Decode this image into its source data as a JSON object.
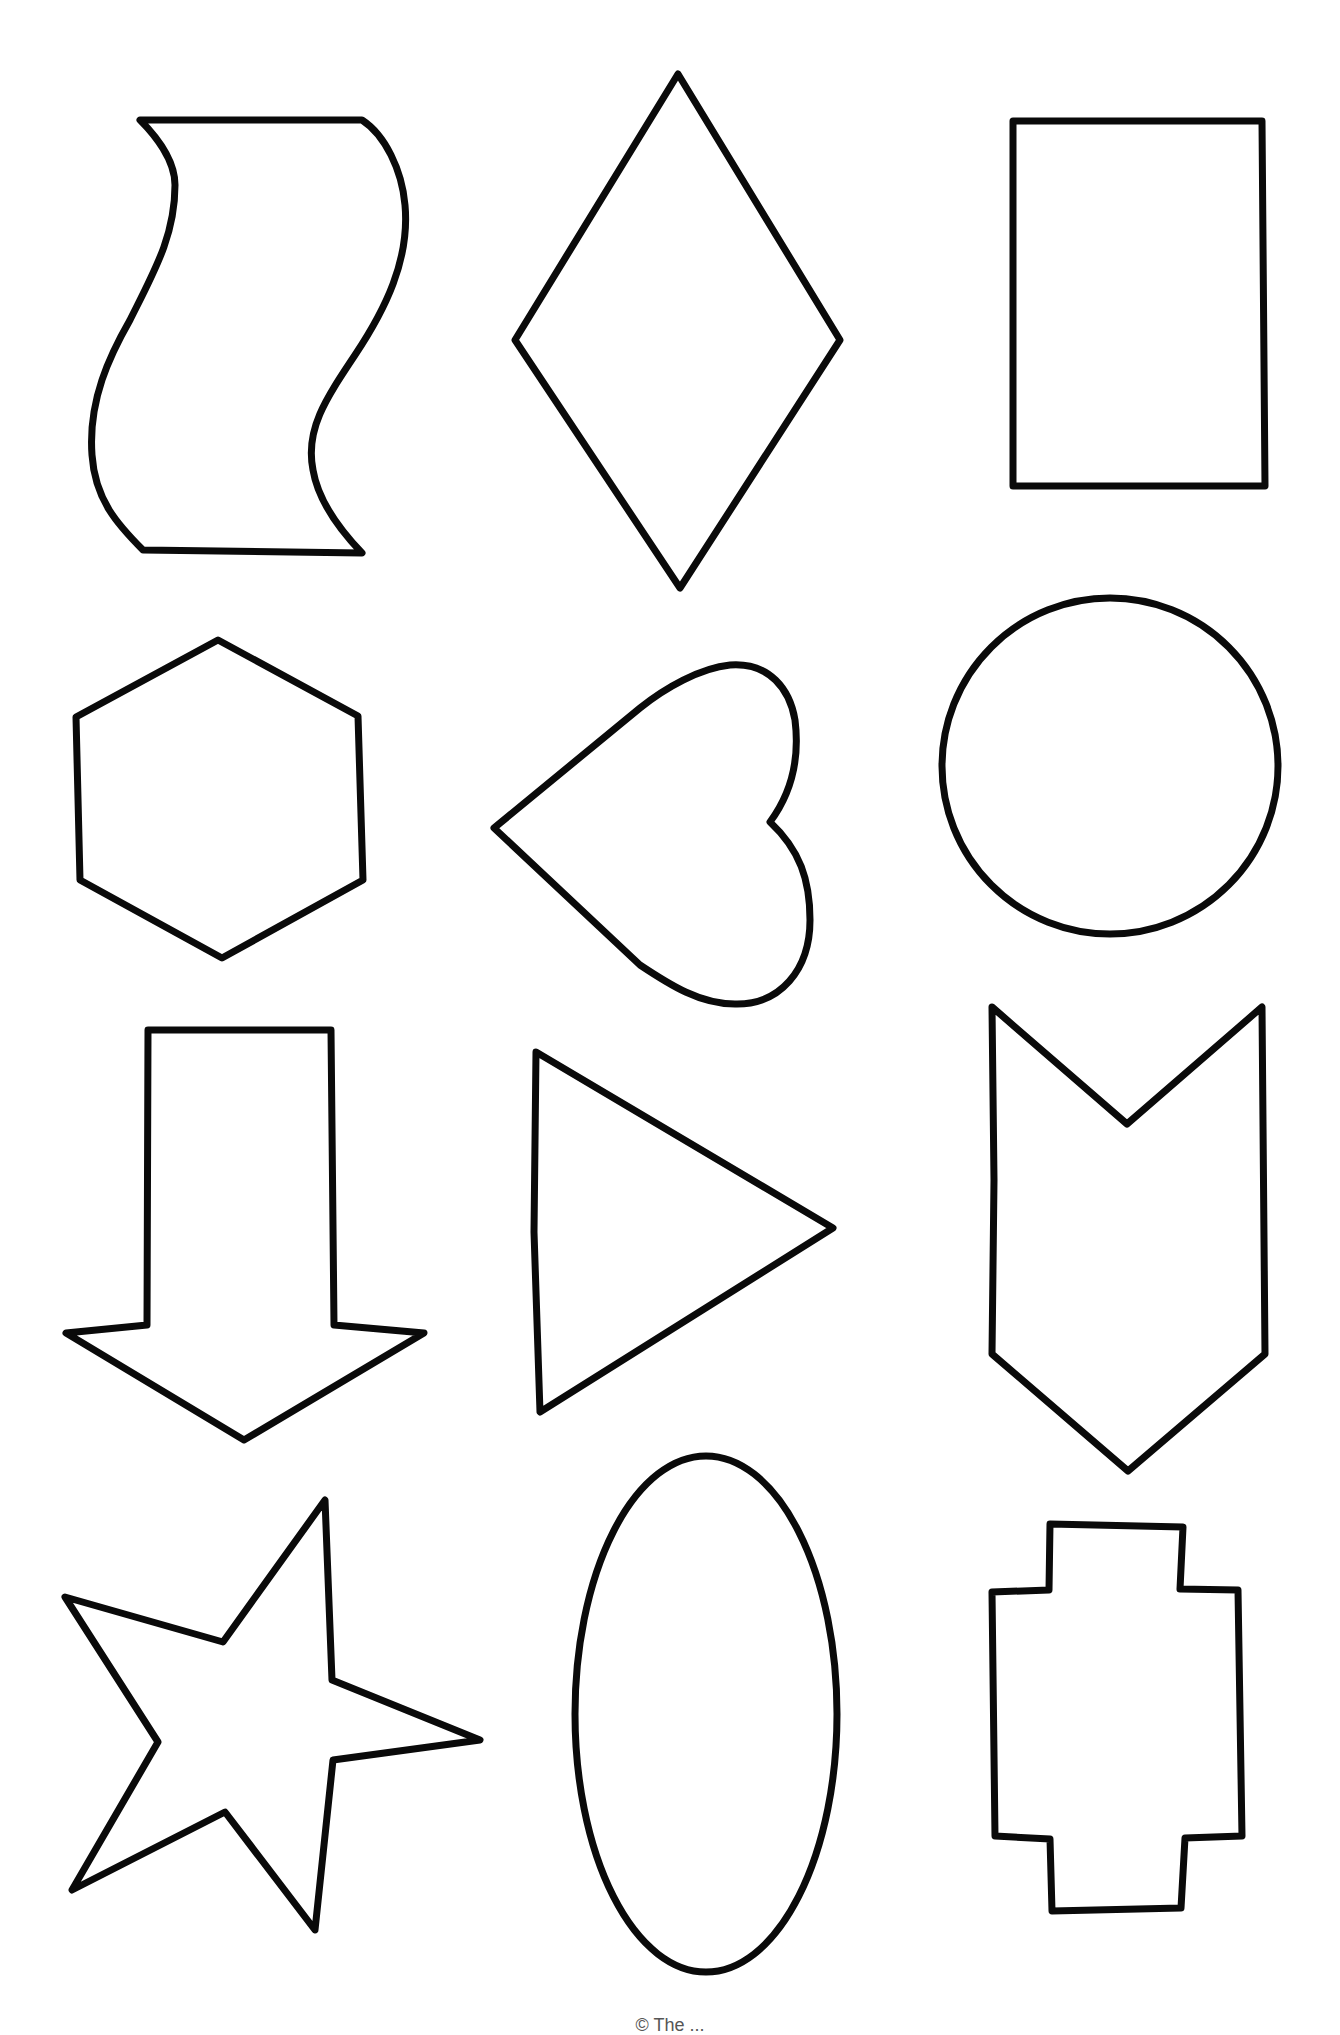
{
  "page": {
    "type": "shapes-worksheet",
    "background_color": "#ffffff",
    "stroke_color": "#0a0a0a",
    "layout": {
      "columns": 3,
      "rows": 4
    }
  },
  "shapes": [
    {
      "row": 1,
      "col": 1,
      "name": "wavy-banner"
    },
    {
      "row": 1,
      "col": 2,
      "name": "diamond"
    },
    {
      "row": 1,
      "col": 3,
      "name": "rectangle"
    },
    {
      "row": 2,
      "col": 1,
      "name": "hexagon"
    },
    {
      "row": 2,
      "col": 2,
      "name": "heart"
    },
    {
      "row": 2,
      "col": 3,
      "name": "circle"
    },
    {
      "row": 3,
      "col": 1,
      "name": "down-arrow"
    },
    {
      "row": 3,
      "col": 2,
      "name": "triangle"
    },
    {
      "row": 3,
      "col": 3,
      "name": "chevron-banner"
    },
    {
      "row": 4,
      "col": 1,
      "name": "star"
    },
    {
      "row": 4,
      "col": 2,
      "name": "oval"
    },
    {
      "row": 4,
      "col": 3,
      "name": "plus-cross"
    }
  ],
  "footer": {
    "text": "© The ..."
  }
}
